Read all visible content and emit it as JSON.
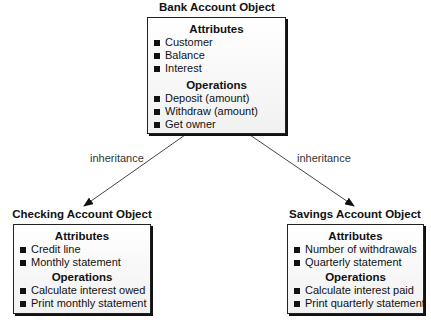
{
  "diagram": {
    "type": "class-inheritance",
    "parent": {
      "title": "Bank Account Object",
      "attributes_heading": "Attributes",
      "attributes": [
        "Customer",
        "Balance",
        "Interest"
      ],
      "operations_heading": "Operations",
      "operations": [
        "Deposit (amount)",
        "Withdraw (amount)",
        "Get owner"
      ]
    },
    "children": [
      {
        "title": "Checking Account Object",
        "attributes_heading": "Attributes",
        "attributes": [
          "Credit line",
          "Monthly statement"
        ],
        "operations_heading": "Operations",
        "operations": [
          "Calculate interest owed",
          "Print monthly statement"
        ]
      },
      {
        "title": "Savings Account Object",
        "attributes_heading": "Attributes",
        "attributes": [
          "Number of withdrawals",
          "Quarterly statement"
        ],
        "operations_heading": "Operations",
        "operations": [
          "Calculate interest paid",
          "Print quarterly statement"
        ]
      }
    ],
    "edges": [
      {
        "from": "Bank Account Object",
        "to": "Checking Account Object",
        "label": "inheritance"
      },
      {
        "from": "Bank Account Object",
        "to": "Savings Account Object",
        "label": "inheritance"
      }
    ]
  },
  "colors": {
    "line": "#222222",
    "box_fill_top": "#ffffff",
    "box_fill_bottom": "#f1f1f1",
    "text": "#111111"
  }
}
